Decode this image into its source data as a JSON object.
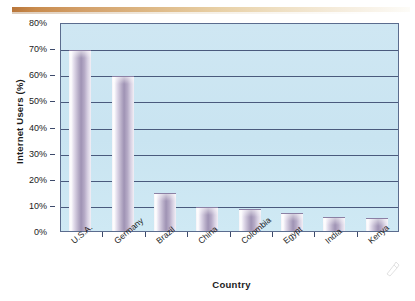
{
  "decor": {
    "top_rule_color_start": "#b9763a",
    "top_rule_color_end": "#fdfcf8"
  },
  "colors": {
    "plot_background": "#c9e4f1",
    "gridline": "#4a5a7d",
    "axis": "#5b6c8e",
    "bar_fill": "#9f93b4",
    "bar_highlight": "#ffffff",
    "text": "#1b1b1b"
  },
  "chart_data": {
    "type": "bar",
    "title": "",
    "xlabel": "Country",
    "ylabel": "Internet Users (%)",
    "categories": [
      "U.S.A.",
      "Germany",
      "Brazil",
      "China",
      "Colombia",
      "Egypt",
      "India",
      "Kenya"
    ],
    "values": [
      69,
      59,
      14,
      9,
      8,
      6.5,
      5,
      4.5
    ],
    "ylim": [
      0,
      80
    ],
    "ytick_labels": [
      "80%",
      "70%",
      "60%",
      "50%",
      "40%",
      "30%",
      "20%",
      "10%",
      "0%"
    ],
    "ytick_values": [
      80,
      70,
      60,
      50,
      40,
      30,
      20,
      10,
      0
    ],
    "grid": "horizontal",
    "legend": "none",
    "series": [
      {
        "name": "Internet Users (%)",
        "values": [
          69,
          59,
          14,
          9,
          8,
          6.5,
          5,
          4.5
        ]
      }
    ]
  }
}
